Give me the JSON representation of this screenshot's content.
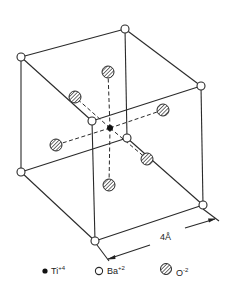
{
  "diagram": {
    "colors": {
      "line": "#2a2a2a",
      "ti": "#111111",
      "ba_fill": "#ffffff",
      "o_fill": "#9a9a9a"
    },
    "cube_vertices": [
      {
        "id": "A",
        "x": 21,
        "y": 57
      },
      {
        "id": "B",
        "x": 125,
        "y": 29
      },
      {
        "id": "C",
        "x": 201,
        "y": 86
      },
      {
        "id": "D",
        "x": 92,
        "y": 121
      },
      {
        "id": "E",
        "x": 21,
        "y": 172
      },
      {
        "id": "F",
        "x": 127,
        "y": 138
      },
      {
        "id": "G",
        "x": 203,
        "y": 205
      },
      {
        "id": "H",
        "x": 95,
        "y": 241
      }
    ],
    "ti_atom": {
      "x": 110,
      "y": 128
    },
    "o_atoms": [
      {
        "name": "top",
        "x": 108,
        "y": 72
      },
      {
        "name": "bottom",
        "x": 109,
        "y": 185
      },
      {
        "name": "left",
        "x": 56,
        "y": 145
      },
      {
        "name": "right",
        "x": 163,
        "y": 110
      },
      {
        "name": "back",
        "x": 75,
        "y": 97
      },
      {
        "name": "front",
        "x": 147,
        "y": 159
      }
    ],
    "dimension": {
      "label": "4",
      "unit": "Å"
    },
    "legend": [
      {
        "symbol": "filled-dot",
        "label": "Ti",
        "charge": "+4"
      },
      {
        "symbol": "open-circle",
        "label": "Ba",
        "charge": "+2"
      },
      {
        "symbol": "hatched-circle",
        "label": "O",
        "charge": "-2"
      }
    ]
  }
}
